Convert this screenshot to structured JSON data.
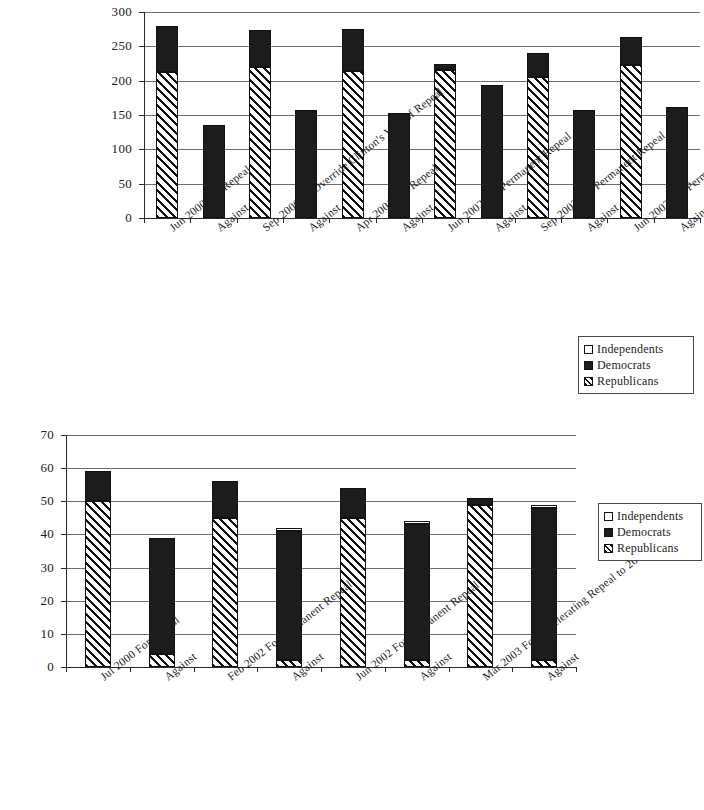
{
  "legend": {
    "position": "right",
    "entries": [
      {
        "key": "independents",
        "label": "Independents",
        "swatch": "white-square-icon"
      },
      {
        "key": "democrats",
        "label": "Democrats",
        "swatch": "black-square-icon"
      },
      {
        "key": "republicans",
        "label": "Republicans",
        "swatch": "hatched-square-icon"
      }
    ]
  },
  "chart_data": [
    {
      "id": "house-votes",
      "type": "bar",
      "stacked": true,
      "title": "",
      "subtitle": "",
      "xlabel": "",
      "ylabel": "",
      "ylim": [
        0,
        300
      ],
      "yticks": [
        0,
        50,
        100,
        150,
        200,
        250,
        300
      ],
      "ytick_labels": [
        "0",
        "50",
        "100",
        "150",
        "200",
        "250",
        "300"
      ],
      "grid": true,
      "legend_entries": [
        "Independents",
        "Democrats",
        "Republicans"
      ],
      "categories": [
        "Jun 2000 For Repeal",
        "Against",
        "Sep 2000 To Override Clinton's Veto of Repeal",
        "Against",
        "Apr 2001 For Repeal",
        "Against",
        "Jun 2002 For Permanent Repeal",
        "Against",
        "Sep 2002 For Permanent Repeal",
        "Against",
        "Jun 2003 For Permanent Repeal",
        "Against"
      ],
      "series": [
        {
          "name": "Republicans",
          "values": [
            212,
            0,
            220,
            0,
            214,
            0,
            216,
            0,
            206,
            0,
            223,
            0
          ]
        },
        {
          "name": "Democrats",
          "values": [
            67,
            136,
            54,
            157,
            61,
            153,
            9,
            194,
            35,
            157,
            41,
            162
          ]
        },
        {
          "name": "Independents",
          "values": [
            0,
            0,
            0,
            0,
            0,
            0,
            0,
            0,
            0,
            0,
            0,
            0
          ]
        }
      ],
      "totals": [
        279,
        136,
        274,
        157,
        275,
        153,
        225,
        194,
        241,
        157,
        264,
        162
      ]
    },
    {
      "id": "senate-votes",
      "type": "bar",
      "stacked": true,
      "title": "",
      "subtitle": "",
      "xlabel": "",
      "ylabel": "",
      "ylim": [
        0,
        70
      ],
      "yticks": [
        0,
        10,
        20,
        30,
        40,
        50,
        60,
        70
      ],
      "ytick_labels": [
        "0",
        "10",
        "20",
        "30",
        "40",
        "50",
        "60",
        "70"
      ],
      "grid": true,
      "legend_entries": [
        "Independents",
        "Democrats",
        "Republicans"
      ],
      "categories": [
        "Jul 2000 For Repeal",
        "Against",
        "Feb 2002 For Permanent Repeal",
        "Against",
        "Jun 2002 For Permanent Repeal",
        "Against",
        "Mar 2003 For Accelerating Repeal to 2009",
        "Against"
      ],
      "series": [
        {
          "name": "Republicans",
          "values": [
            50,
            4,
            45,
            2,
            45,
            2,
            49,
            2
          ]
        },
        {
          "name": "Democrats",
          "values": [
            9,
            35,
            11,
            39,
            9,
            41,
            2,
            46
          ]
        },
        {
          "name": "Independents",
          "values": [
            0,
            0,
            0,
            1,
            0,
            1,
            0,
            1
          ]
        }
      ],
      "totals": [
        59,
        39,
        56,
        42,
        54,
        44,
        51,
        49
      ]
    }
  ],
  "colors": {
    "democrats": "#1c1c1c",
    "republicans_hatch": "#111111",
    "independents": "#ffffff",
    "gridline": "#6e6e6e",
    "axis": "#2a2a2a"
  }
}
